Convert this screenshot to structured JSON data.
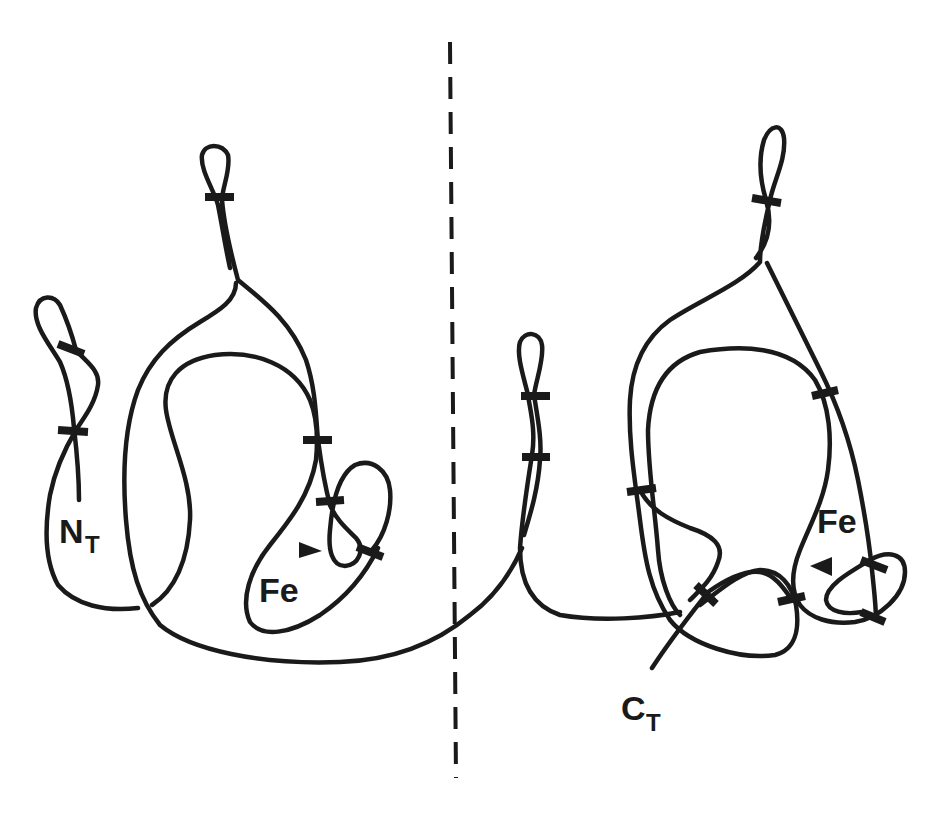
{
  "figure": {
    "type": "protein-fold-topology-diagram",
    "colors": {
      "ink": "#1a1a1a",
      "background": "#ffffff"
    },
    "labels": {
      "n_terminus": {
        "main": "N",
        "sub": "T"
      },
      "c_terminus": {
        "main": "C",
        "sub": "T"
      },
      "iron_left": "Fe",
      "iron_right": "Fe"
    },
    "features": {
      "divider": "dashed vertical line separating two domains",
      "left_domain_bridges": 6,
      "right_domain_bridges": 9,
      "iron_markers": 2
    }
  }
}
